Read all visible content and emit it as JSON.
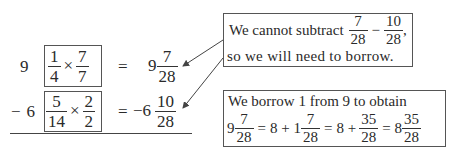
{
  "problem": {
    "row1": {
      "whole": "9",
      "mult": {
        "a_num": "1",
        "a_den": "4",
        "op": "×",
        "b_num": "7",
        "b_den": "7"
      },
      "eq": "=",
      "result": {
        "whole": "9",
        "num": "7",
        "den": "28"
      }
    },
    "row2": {
      "sign": "−",
      "whole": "6",
      "mult": {
        "a_num": "5",
        "a_den": "14",
        "op": "×",
        "b_num": "2",
        "b_den": "2"
      },
      "eq": "=",
      "result": {
        "whole": "−6",
        "num": "10",
        "den": "28"
      }
    }
  },
  "note1": {
    "line1_prefix": "We cannot subtract",
    "f1_num": "7",
    "f1_den": "28",
    "minus": "−",
    "f2_num": "10",
    "f2_den": "28",
    "comma": ",",
    "line2": "so we will need to borrow."
  },
  "note2": {
    "line1": "We borrow 1 from 9 to obtain",
    "t1_whole": "9",
    "t1_num": "7",
    "t1_den": "28",
    "eq": "=",
    "t2": "8 + 1",
    "t2_num": "7",
    "t2_den": "28",
    "t3": "8 +",
    "t3_num": "35",
    "t3_den": "28",
    "t4_whole": "8",
    "t4_num": "35",
    "t4_den": "28"
  }
}
